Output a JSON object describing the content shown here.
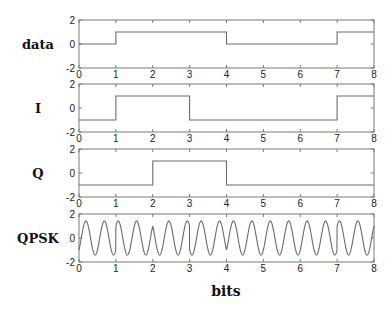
{
  "chart_data": {
    "type": "line",
    "title": "",
    "xlabel": "bits",
    "xlim": [
      0,
      8
    ],
    "xticks": [
      "0",
      "1",
      "2",
      "3",
      "4",
      "5",
      "6",
      "7",
      "8"
    ],
    "ylim": [
      -2,
      2
    ],
    "yticks": [
      "2",
      "0",
      "-2"
    ],
    "grid": false,
    "subplots": [
      {
        "label": "data",
        "style": "step",
        "x": [
          0,
          1,
          2,
          3,
          4,
          5,
          6,
          7,
          8
        ],
        "values": [
          0,
          1,
          1,
          1,
          0,
          0,
          0,
          1,
          1
        ]
      },
      {
        "label": "I",
        "style": "step",
        "x": [
          0,
          1,
          2,
          3,
          4,
          5,
          6,
          7,
          8
        ],
        "values": [
          -1,
          1,
          1,
          -1,
          -1,
          -1,
          -1,
          1,
          1
        ]
      },
      {
        "label": "Q",
        "style": "step",
        "x": [
          0,
          1,
          2,
          3,
          4,
          5,
          6,
          7,
          8
        ],
        "values": [
          -1,
          -1,
          1,
          1,
          -1,
          -1,
          -1,
          -1,
          -1
        ]
      },
      {
        "label": "QPSK",
        "style": "waveform",
        "carrier_cycles_per_bit": 2,
        "formula": "I*cos(2*pi*2*t) - Q*sin(2*pi*2*t)",
        "amplitude": 1.41
      }
    ]
  }
}
